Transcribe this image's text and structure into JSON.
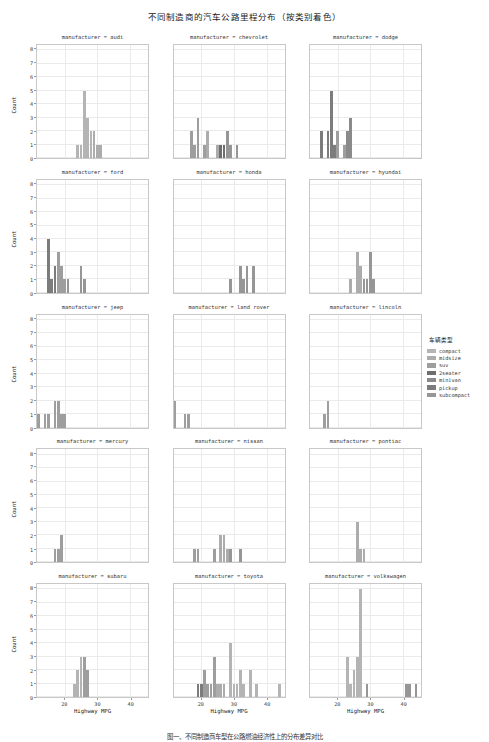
{
  "title": "不同制造商的汽车公路里程分布（按类别着色）",
  "caption": "图一、不同制造商车型在公路燃油经济性上的分布差异对比",
  "axes": {
    "xlabel": "Highway MPG",
    "ylabel": "Count",
    "xticks": [
      20,
      30,
      40
    ],
    "yticks": [
      0,
      1,
      2,
      3,
      4,
      5,
      6,
      7,
      8
    ],
    "xlim": [
      11.5,
      45.5
    ],
    "ylim": [
      0,
      8.4
    ],
    "grid": true
  },
  "legend": {
    "title": "车辆类型",
    "position": "right",
    "items": [
      {
        "label": "compact",
        "color": "#b4b4b4"
      },
      {
        "label": "midsize",
        "color": "#acacac"
      },
      {
        "label": "suv",
        "color": "#9e9e9e"
      },
      {
        "label": "2seater",
        "color": "#6e6e6e"
      },
      {
        "label": "minivan",
        "color": "#8a8a8a"
      },
      {
        "label": "pickup",
        "color": "#7c7c7c"
      },
      {
        "label": "subcompact",
        "color": "#969696"
      }
    ]
  },
  "chart_data": {
    "type": "bar",
    "title": "不同制造商的汽车公路里程分布（按类别着色）",
    "xlabel": "Highway MPG",
    "ylabel": "Count",
    "xlim": [
      11.5,
      45.5
    ],
    "ylim": [
      0,
      8.4
    ],
    "facet_variable": "manufacturer",
    "color_variable": "车辆类型",
    "layout": {
      "rows": 5,
      "cols": 3
    },
    "facets": [
      {
        "name": "manufacturer = audi",
        "bars": [
          {
            "x": 24,
            "value": 1,
            "class": "compact"
          },
          {
            "x": 25,
            "value": 1,
            "class": "compact"
          },
          {
            "x": 26,
            "value": 5,
            "class": "compact"
          },
          {
            "x": 27,
            "value": 3,
            "class": "compact"
          },
          {
            "x": 28,
            "value": 2,
            "class": "compact"
          },
          {
            "x": 29,
            "value": 2,
            "class": "midsize"
          },
          {
            "x": 30,
            "value": 1,
            "class": "midsize"
          },
          {
            "x": 31,
            "value": 1,
            "class": "midsize"
          }
        ]
      },
      {
        "name": "manufacturer = chevrolet",
        "bars": [
          {
            "x": 17,
            "value": 2,
            "class": "suv"
          },
          {
            "x": 18,
            "value": 1,
            "class": "suv"
          },
          {
            "x": 19,
            "value": 3,
            "class": "suv"
          },
          {
            "x": 21,
            "value": 1,
            "class": "suv"
          },
          {
            "x": 22,
            "value": 2,
            "class": "midsize"
          },
          {
            "x": 25,
            "value": 1,
            "class": "midsize"
          },
          {
            "x": 26,
            "value": 1,
            "class": "2seater"
          },
          {
            "x": 27,
            "value": 1,
            "class": "2seater"
          },
          {
            "x": 28,
            "value": 2,
            "class": "subcompact"
          },
          {
            "x": 29,
            "value": 1,
            "class": "subcompact"
          },
          {
            "x": 31,
            "value": 1,
            "class": "subcompact"
          }
        ]
      },
      {
        "name": "manufacturer = dodge",
        "bars": [
          {
            "x": 15,
            "value": 2,
            "class": "pickup"
          },
          {
            "x": 17,
            "value": 2,
            "class": "pickup"
          },
          {
            "x": 18,
            "value": 5,
            "class": "pickup"
          },
          {
            "x": 19,
            "value": 1,
            "class": "pickup"
          },
          {
            "x": 20,
            "value": 2,
            "class": "suv"
          },
          {
            "x": 22,
            "value": 1,
            "class": "suv"
          },
          {
            "x": 23,
            "value": 2,
            "class": "minivan"
          },
          {
            "x": 24,
            "value": 3,
            "class": "minivan"
          }
        ]
      },
      {
        "name": "manufacturer = ford",
        "bars": [
          {
            "x": 15,
            "value": 4,
            "class": "pickup"
          },
          {
            "x": 16,
            "value": 1,
            "class": "pickup"
          },
          {
            "x": 17,
            "value": 2,
            "class": "pickup"
          },
          {
            "x": 18,
            "value": 3,
            "class": "suv"
          },
          {
            "x": 19,
            "value": 2,
            "class": "suv"
          },
          {
            "x": 20,
            "value": 1,
            "class": "suv"
          },
          {
            "x": 21,
            "value": 1,
            "class": "subcompact"
          },
          {
            "x": 25,
            "value": 2,
            "class": "subcompact"
          },
          {
            "x": 26,
            "value": 1,
            "class": "subcompact"
          }
        ]
      },
      {
        "name": "manufacturer = honda",
        "bars": [
          {
            "x": 29,
            "value": 1,
            "class": "subcompact"
          },
          {
            "x": 32,
            "value": 2,
            "class": "subcompact"
          },
          {
            "x": 33,
            "value": 1,
            "class": "subcompact"
          },
          {
            "x": 34,
            "value": 2,
            "class": "subcompact"
          },
          {
            "x": 36,
            "value": 2,
            "class": "subcompact"
          }
        ]
      },
      {
        "name": "manufacturer = hyundai",
        "bars": [
          {
            "x": 24,
            "value": 1,
            "class": "midsize"
          },
          {
            "x": 26,
            "value": 3,
            "class": "midsize"
          },
          {
            "x": 27,
            "value": 2,
            "class": "midsize"
          },
          {
            "x": 28,
            "value": 1,
            "class": "subcompact"
          },
          {
            "x": 29,
            "value": 1,
            "class": "subcompact"
          },
          {
            "x": 30,
            "value": 3,
            "class": "subcompact"
          },
          {
            "x": 31,
            "value": 1,
            "class": "subcompact"
          }
        ]
      },
      {
        "name": "manufacturer = jeep",
        "bars": [
          {
            "x": 12,
            "value": 1,
            "class": "suv"
          },
          {
            "x": 14,
            "value": 1,
            "class": "suv"
          },
          {
            "x": 15,
            "value": 1,
            "class": "suv"
          },
          {
            "x": 17,
            "value": 2,
            "class": "suv"
          },
          {
            "x": 18,
            "value": 2,
            "class": "suv"
          },
          {
            "x": 19,
            "value": 1,
            "class": "suv"
          },
          {
            "x": 20,
            "value": 1,
            "class": "suv"
          }
        ]
      },
      {
        "name": "manufacturer = land rover",
        "bars": [
          {
            "x": 12,
            "value": 2,
            "class": "suv"
          },
          {
            "x": 15,
            "value": 1,
            "class": "suv"
          },
          {
            "x": 16,
            "value": 1,
            "class": "suv"
          }
        ]
      },
      {
        "name": "manufacturer = lincoln",
        "bars": [
          {
            "x": 16,
            "value": 1,
            "class": "suv"
          },
          {
            "x": 17,
            "value": 2,
            "class": "suv"
          }
        ]
      },
      {
        "name": "manufacturer = mercury",
        "bars": [
          {
            "x": 17,
            "value": 1,
            "class": "suv"
          },
          {
            "x": 18,
            "value": 1,
            "class": "suv"
          },
          {
            "x": 19,
            "value": 2,
            "class": "suv"
          }
        ]
      },
      {
        "name": "manufacturer = nissan",
        "bars": [
          {
            "x": 18,
            "value": 1,
            "class": "suv"
          },
          {
            "x": 19,
            "value": 1,
            "class": "suv"
          },
          {
            "x": 24,
            "value": 1,
            "class": "suv"
          },
          {
            "x": 26,
            "value": 2,
            "class": "midsize"
          },
          {
            "x": 27,
            "value": 2,
            "class": "midsize"
          },
          {
            "x": 28,
            "value": 1,
            "class": "midsize"
          },
          {
            "x": 29,
            "value": 1,
            "class": "subcompact"
          },
          {
            "x": 32,
            "value": 1,
            "class": "subcompact"
          }
        ]
      },
      {
        "name": "manufacturer = pontiac",
        "bars": [
          {
            "x": 26,
            "value": 3,
            "class": "midsize"
          },
          {
            "x": 27,
            "value": 1,
            "class": "midsize"
          },
          {
            "x": 28,
            "value": 1,
            "class": "midsize"
          }
        ]
      },
      {
        "name": "manufacturer = subaru",
        "bars": [
          {
            "x": 23,
            "value": 1,
            "class": "compact"
          },
          {
            "x": 24,
            "value": 2,
            "class": "compact"
          },
          {
            "x": 25,
            "value": 3,
            "class": "compact"
          },
          {
            "x": 26,
            "value": 3,
            "class": "suv"
          },
          {
            "x": 27,
            "value": 2,
            "class": "suv"
          }
        ]
      },
      {
        "name": "manufacturer = toyota",
        "bars": [
          {
            "x": 19,
            "value": 1,
            "class": "pickup"
          },
          {
            "x": 20,
            "value": 1,
            "class": "pickup"
          },
          {
            "x": 21,
            "value": 2,
            "class": "suv"
          },
          {
            "x": 22,
            "value": 1,
            "class": "suv"
          },
          {
            "x": 23,
            "value": 1,
            "class": "suv"
          },
          {
            "x": 24,
            "value": 3,
            "class": "suv"
          },
          {
            "x": 25,
            "value": 1,
            "class": "midsize"
          },
          {
            "x": 26,
            "value": 1,
            "class": "midsize"
          },
          {
            "x": 27,
            "value": 1,
            "class": "midsize"
          },
          {
            "x": 29,
            "value": 4,
            "class": "compact"
          },
          {
            "x": 30,
            "value": 1,
            "class": "compact"
          },
          {
            "x": 31,
            "value": 1,
            "class": "compact"
          },
          {
            "x": 32,
            "value": 2,
            "class": "compact"
          },
          {
            "x": 33,
            "value": 1,
            "class": "compact"
          },
          {
            "x": 35,
            "value": 2,
            "class": "compact"
          },
          {
            "x": 37,
            "value": 1,
            "class": "compact"
          },
          {
            "x": 44,
            "value": 1,
            "class": "compact"
          }
        ]
      },
      {
        "name": "manufacturer = volkswagen",
        "bars": [
          {
            "x": 23,
            "value": 3,
            "class": "compact"
          },
          {
            "x": 24,
            "value": 1,
            "class": "compact"
          },
          {
            "x": 25,
            "value": 2,
            "class": "compact"
          },
          {
            "x": 26,
            "value": 3,
            "class": "compact"
          },
          {
            "x": 27,
            "value": 8,
            "class": "compact"
          },
          {
            "x": 29,
            "value": 1,
            "class": "subcompact"
          },
          {
            "x": 41,
            "value": 1,
            "class": "subcompact"
          },
          {
            "x": 42,
            "value": 1,
            "class": "subcompact"
          },
          {
            "x": 44,
            "value": 1,
            "class": "subcompact"
          }
        ]
      }
    ]
  }
}
